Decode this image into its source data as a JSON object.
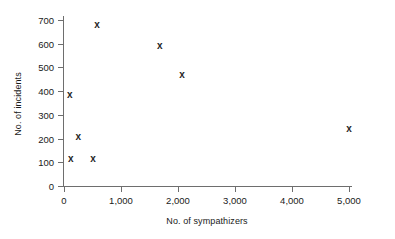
{
  "chart_data": {
    "type": "scatter",
    "title": "",
    "xlabel": "No. of sympathizers",
    "ylabel": "No. of incidents",
    "xlim": [
      0,
      5000
    ],
    "ylim": [
      0,
      700
    ],
    "grid": false,
    "legend": null,
    "marker_symbol": "x",
    "marker_color": "#262626",
    "axis_color": "#6e6e6e",
    "xticks": [
      {
        "value": 0,
        "label": "0"
      },
      {
        "value": 1000,
        "label": "1,000"
      },
      {
        "value": 2000,
        "label": "2,000"
      },
      {
        "value": 3000,
        "label": "3,000"
      },
      {
        "value": 4000,
        "label": "4,000"
      },
      {
        "value": 5000,
        "label": "5,000"
      }
    ],
    "yticks": [
      {
        "value": 0,
        "label": "0"
      },
      {
        "value": 100,
        "label": "100"
      },
      {
        "value": 200,
        "label": "200"
      },
      {
        "value": 300,
        "label": "300"
      },
      {
        "value": 400,
        "label": "400"
      },
      {
        "value": 500,
        "label": "500"
      },
      {
        "value": 600,
        "label": "600"
      },
      {
        "value": 700,
        "label": "700"
      }
    ],
    "points": [
      {
        "x": 120,
        "y": 115
      },
      {
        "x": 100,
        "y": 385
      },
      {
        "x": 250,
        "y": 205
      },
      {
        "x": 510,
        "y": 115
      },
      {
        "x": 580,
        "y": 680
      },
      {
        "x": 1680,
        "y": 590
      },
      {
        "x": 2070,
        "y": 470
      },
      {
        "x": 5000,
        "y": 240
      }
    ]
  }
}
